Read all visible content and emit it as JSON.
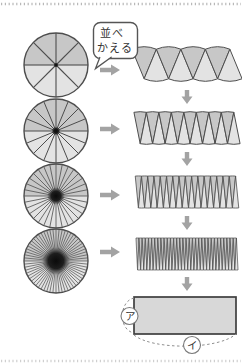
{
  "bubble": {
    "line1": "並べ",
    "line2": "かえる"
  },
  "rows": [
    {
      "sectors": 8
    },
    {
      "sectors": 16
    },
    {
      "sectors": 32
    },
    {
      "sectors": 64
    }
  ],
  "final_rect": {
    "side_label": "ア",
    "bottom_label": "イ"
  },
  "colors": {
    "stroke": "#4d4d4d",
    "sector_dark": "#c7c7c7",
    "sector_light": "#e3e3e3",
    "arrow": "#a3a3a3",
    "rect_fill": "#d8d8d8",
    "rect_stroke": "#3f3f3f",
    "dash": "#8f8f8f",
    "border_dots": "#b8b8b8",
    "bubble_stroke": "#555555",
    "text": "#333333"
  }
}
